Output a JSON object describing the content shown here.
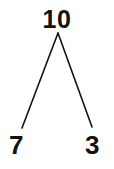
{
  "diagram": {
    "type": "number-bond-tree",
    "background_color": "#ffffff",
    "stroke_color": "#121212",
    "text_color": "#121212",
    "root": {
      "label": "10",
      "x": 58,
      "y": 20
    },
    "children": [
      {
        "label": "7",
        "side": "left",
        "x": 19,
        "y": 145
      },
      {
        "label": "3",
        "side": "right",
        "x": 95,
        "y": 145
      }
    ],
    "branches": [
      {
        "name": "left-branch",
        "from_x": 58,
        "from_y": 33,
        "to_x": 22,
        "to_y": 128
      },
      {
        "name": "right-branch",
        "from_x": 58,
        "from_y": 33,
        "to_x": 92,
        "to_y": 127
      }
    ]
  }
}
